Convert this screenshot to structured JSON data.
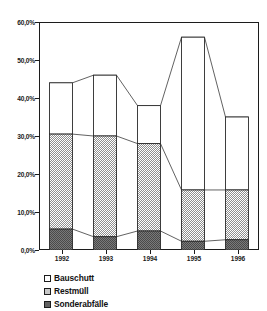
{
  "chart_data": {
    "type": "bar",
    "subtype": "stacked-column-with-connectors",
    "title": "",
    "subtitle": "",
    "xlabel": "",
    "ylabel": "",
    "categories": [
      "1992",
      "1993",
      "1994",
      "1995",
      "1996"
    ],
    "series": [
      {
        "name": "Sonderabfälle",
        "color": "#595959",
        "fill": "dark-gray-dither",
        "values": [
          5.5,
          3.5,
          5.0,
          2.3,
          2.7
        ]
      },
      {
        "name": "Restmüll",
        "color": "#a8a8a8",
        "fill": "light-gray-dither",
        "values": [
          25.0,
          26.5,
          23.0,
          13.5,
          13.1
        ]
      },
      {
        "name": "Bauschutt",
        "color": "#ffffff",
        "fill": "white",
        "values": [
          13.5,
          16.0,
          10.0,
          40.2,
          19.2
        ]
      }
    ],
    "cumulative_tops": {
      "sonderabfaelle": [
        5.5,
        3.5,
        5.0,
        2.3,
        2.7
      ],
      "restmuell": [
        30.5,
        30.0,
        28.0,
        15.8,
        15.8
      ],
      "bauschutt": [
        44.0,
        46.0,
        38.0,
        56.0,
        35.0
      ]
    },
    "ylim": [
      0,
      60
    ],
    "yticks": [
      0,
      10,
      20,
      30,
      40,
      50,
      60
    ],
    "ytick_labels": [
      "0,0%",
      "10,0%",
      "20,0%",
      "30,0%",
      "40,0%",
      "50,0%",
      "60,0%"
    ],
    "grid": false,
    "legend_position": "below-left",
    "legend_entries": [
      "Bauschutt",
      "Restmüll",
      "Sonderabfälle"
    ]
  },
  "axis": {
    "y_tick_labels": [
      "60,0%",
      "50,0%",
      "40,0%",
      "30,0%",
      "20,0%",
      "10,0%",
      "0,0%"
    ],
    "x_tick_labels": [
      "1992",
      "1993",
      "1994",
      "1995",
      "1996"
    ]
  },
  "legend": {
    "items": [
      {
        "label": "Bauschutt",
        "swatch": "white-square-icon"
      },
      {
        "label": "Restmüll",
        "swatch": "light-gray-square-icon"
      },
      {
        "label": "Sonderabfälle",
        "swatch": "dark-gray-square-icon"
      }
    ]
  }
}
